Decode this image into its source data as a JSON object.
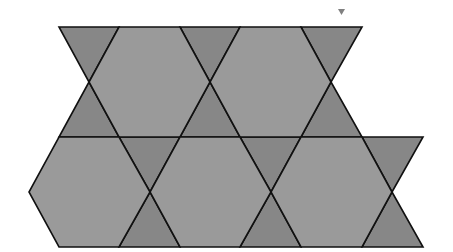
{
  "diagram": {
    "type": "trihexagonal-tiling",
    "colors": {
      "hexagon_fill": "#9a9a9a",
      "triangle_fill": "#878787",
      "stroke": "#111111",
      "marker": "#808080",
      "background": "#ffffff"
    },
    "marker": {
      "shape": "inverted-triangle",
      "points": [
        [
          338,
          9
        ],
        [
          345,
          9
        ],
        [
          341.5,
          15
        ]
      ]
    },
    "hexagons": [
      {
        "row": 1,
        "points": [
          [
            119,
            27
          ],
          [
            180,
            27
          ],
          [
            210,
            82
          ],
          [
            180,
            137
          ],
          [
            119,
            137
          ],
          [
            89,
            82
          ]
        ]
      },
      {
        "row": 1,
        "points": [
          [
            240,
            27
          ],
          [
            301,
            27
          ],
          [
            331,
            82
          ],
          [
            301,
            137
          ],
          [
            240,
            137
          ],
          [
            210,
            82
          ]
        ]
      },
      {
        "row": 2,
        "points": [
          [
            59,
            137
          ],
          [
            119,
            137
          ],
          [
            150,
            192
          ],
          [
            119,
            247
          ],
          [
            59,
            247
          ],
          [
            29,
            192
          ]
        ]
      },
      {
        "row": 2,
        "points": [
          [
            180,
            137
          ],
          [
            240,
            137
          ],
          [
            271,
            192
          ],
          [
            240,
            247
          ],
          [
            180,
            247
          ],
          [
            150,
            192
          ]
        ]
      },
      {
        "row": 2,
        "points": [
          [
            301,
            137
          ],
          [
            362,
            137
          ],
          [
            392,
            192
          ],
          [
            362,
            247
          ],
          [
            301,
            247
          ],
          [
            271,
            192
          ]
        ]
      }
    ],
    "triangles": [
      {
        "row": 1,
        "points": [
          [
            59,
            27
          ],
          [
            119,
            27
          ],
          [
            89,
            82
          ]
        ]
      },
      {
        "row": 1,
        "points": [
          [
            180,
            27
          ],
          [
            240,
            27
          ],
          [
            210,
            82
          ]
        ]
      },
      {
        "row": 1,
        "points": [
          [
            301,
            27
          ],
          [
            362,
            27
          ],
          [
            331,
            82
          ]
        ]
      },
      {
        "row": 1,
        "points": [
          [
            89,
            82
          ],
          [
            59,
            137
          ],
          [
            119,
            137
          ]
        ]
      },
      {
        "row": 1,
        "points": [
          [
            210,
            82
          ],
          [
            180,
            137
          ],
          [
            240,
            137
          ]
        ]
      },
      {
        "row": 1,
        "points": [
          [
            331,
            82
          ],
          [
            301,
            137
          ],
          [
            362,
            137
          ]
        ]
      },
      {
        "row": 2,
        "points": [
          [
            119,
            137
          ],
          [
            180,
            137
          ],
          [
            150,
            192
          ]
        ]
      },
      {
        "row": 2,
        "points": [
          [
            240,
            137
          ],
          [
            301,
            137
          ],
          [
            271,
            192
          ]
        ]
      },
      {
        "row": 2,
        "points": [
          [
            362,
            137
          ],
          [
            423,
            137
          ],
          [
            392,
            192
          ]
        ]
      },
      {
        "row": 2,
        "points": [
          [
            150,
            192
          ],
          [
            119,
            247
          ],
          [
            180,
            247
          ]
        ]
      },
      {
        "row": 2,
        "points": [
          [
            271,
            192
          ],
          [
            240,
            247
          ],
          [
            301,
            247
          ]
        ]
      },
      {
        "row": 2,
        "points": [
          [
            392,
            192
          ],
          [
            362,
            247
          ],
          [
            423,
            247
          ]
        ]
      }
    ]
  }
}
